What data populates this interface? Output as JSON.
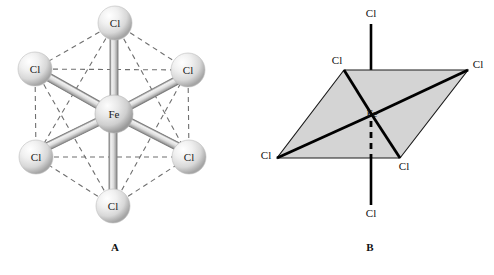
{
  "figure": {
    "background_color": "#ffffff"
  },
  "panels": [
    {
      "id": "A",
      "caption": "A",
      "style": "ball-and-stick",
      "center_atom": "Fe",
      "ligand_atom": "Cl",
      "ligand_count": 6,
      "atoms": [
        {
          "label": "Cl",
          "position": "top",
          "cx": 115,
          "cy": 23,
          "r": 17
        },
        {
          "label": "Cl",
          "position": "upper-left",
          "cx": 35,
          "cy": 69,
          "r": 17
        },
        {
          "label": "Cl",
          "position": "upper-right",
          "cx": 188,
          "cy": 70,
          "r": 17
        },
        {
          "label": "Fe",
          "position": "center",
          "cx": 114,
          "cy": 114,
          "r": 19
        },
        {
          "label": "Cl",
          "position": "lower-left",
          "cx": 36,
          "cy": 157,
          "r": 17
        },
        {
          "label": "Cl",
          "position": "lower-right",
          "cx": 189,
          "cy": 157,
          "r": 17
        },
        {
          "label": "Cl",
          "position": "bottom",
          "cx": 113,
          "cy": 206,
          "r": 17
        }
      ],
      "sphere_colors": {
        "highlight": "#ffffff",
        "mid": "#e2e2e2",
        "edge": "#9a9a9a"
      },
      "bond_colors": {
        "fill": "#dcdcdc",
        "stroke": "#7d7d7d"
      },
      "dashed_color": "#6f6f6f"
    },
    {
      "id": "B",
      "caption": "B",
      "style": "polyhedral-wedge",
      "center_atom": "Fe",
      "ligand_atom": "Cl",
      "ligand_count": 6,
      "vertices": [
        {
          "label": "Cl",
          "position": "axial-top",
          "x": 371,
          "y": 24,
          "label_x": 371,
          "label_y": 14
        },
        {
          "label": "Cl",
          "position": "back-left",
          "x": 344,
          "y": 70,
          "label_x": 337,
          "label_y": 61
        },
        {
          "label": "Cl",
          "position": "back-right",
          "x": 468,
          "y": 70,
          "label_x": 478,
          "label_y": 65
        },
        {
          "label": "Fe",
          "position": "center",
          "x": 372,
          "y": 115,
          "label_x": 372,
          "label_y": 114
        },
        {
          "label": "Cl",
          "position": "front-left",
          "x": 277,
          "y": 158,
          "label_x": 266,
          "label_y": 156
        },
        {
          "label": "Cl",
          "position": "front-right",
          "x": 400,
          "y": 158,
          "label_x": 404,
          "label_y": 167
        },
        {
          "label": "Cl",
          "position": "axial-bottom",
          "x": 371,
          "y": 205,
          "label_x": 371,
          "label_y": 214
        }
      ],
      "plane_fill": "#d4d4d4",
      "plane_stroke": "#1a1a1a",
      "bond_stroke": "#000000",
      "dashed_bond_stroke": "#000000"
    }
  ]
}
